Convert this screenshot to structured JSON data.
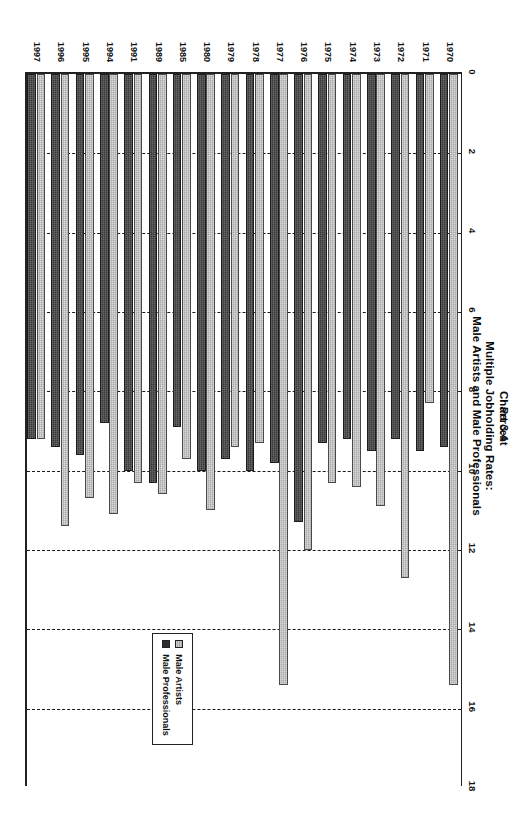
{
  "title": {
    "line1": "Chart 3.4",
    "line2": "Multiple Jobholding Rates:",
    "line3": "Male Artists and Male Professionals"
  },
  "axis": {
    "x_label": "Percent",
    "x_ticks": [
      "0",
      "2",
      "4",
      "6",
      "8",
      "10",
      "12",
      "14",
      "16",
      "18"
    ]
  },
  "legend": {
    "items": [
      {
        "label": "Male Artists"
      },
      {
        "label": "Male Professionals"
      }
    ]
  },
  "colors": {
    "artists": "#a8a8a8",
    "professionals": "#3a3a3a",
    "frame": "#222222",
    "gridline": "#1a1a1a"
  },
  "chart_data": {
    "type": "bar",
    "orientation": "horizontal",
    "title": "Chart 3.4 Multiple Jobholding Rates: Male Artists and Male Professionals",
    "xlabel": "Percent",
    "ylabel": "",
    "xlim": [
      0,
      18
    ],
    "xticks": [
      0,
      2,
      4,
      6,
      8,
      10,
      12,
      14,
      16,
      18
    ],
    "grid": true,
    "legend_position": "right",
    "categories": [
      "1970",
      "1971",
      "1972",
      "1973",
      "1974",
      "1975",
      "1976",
      "1977",
      "1978",
      "1979",
      "1980",
      "1985",
      "1989",
      "1991",
      "1994",
      "1995",
      "1996",
      "1997"
    ],
    "series": [
      {
        "name": "Male Artists",
        "values": [
          15.4,
          8.3,
          12.7,
          10.9,
          10.4,
          10.3,
          12.0,
          15.4,
          9.3,
          9.4,
          11.0,
          9.7,
          10.6,
          10.3,
          11.1,
          10.7,
          11.4,
          9.2
        ]
      },
      {
        "name": "Male Professionals",
        "values": [
          9.4,
          9.5,
          9.2,
          9.5,
          9.2,
          9.3,
          11.3,
          9.8,
          10.0,
          9.7,
          10.0,
          8.9,
          10.3,
          10.0,
          8.8,
          9.6,
          9.4,
          9.2
        ]
      }
    ]
  }
}
